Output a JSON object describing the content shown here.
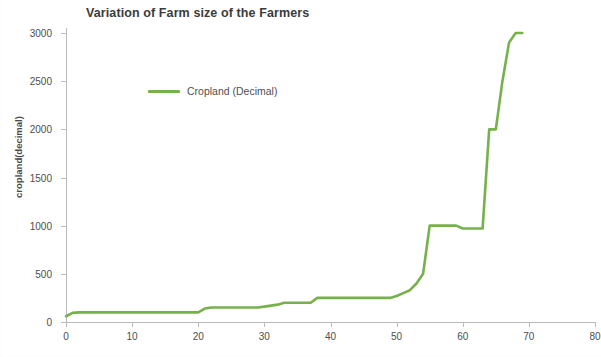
{
  "chart_data": {
    "type": "line",
    "title": "Variation of Farm size of the Farmers",
    "xlabel": "",
    "ylabel": "cropland(decimal)",
    "xlim": [
      0,
      80
    ],
    "ylim": [
      0,
      3000
    ],
    "grid": false,
    "legend_position": "inside-top-left",
    "line_color": "#77B14C",
    "axis_color": "#b9b9b9",
    "text_color": "#4d4d4d",
    "xticks": [
      0,
      10,
      20,
      30,
      40,
      50,
      60,
      70,
      80
    ],
    "yticks": [
      0,
      500,
      1000,
      1500,
      2000,
      2500,
      3000
    ],
    "xtick_labels": [
      "0",
      "10",
      "20",
      "30",
      "40",
      "50",
      "60",
      "70",
      "80"
    ],
    "ytick_labels": [
      "0",
      "500",
      "1000",
      "1500",
      "2000",
      "2500",
      "3000"
    ],
    "series": [
      {
        "name": "Cropland (Decimal)",
        "x": [
          0,
          1,
          2,
          3,
          4,
          5,
          6,
          7,
          8,
          9,
          10,
          11,
          12,
          13,
          14,
          15,
          16,
          17,
          18,
          19,
          20,
          21,
          22,
          23,
          24,
          25,
          26,
          27,
          28,
          29,
          30,
          31,
          32,
          33,
          34,
          35,
          36,
          37,
          38,
          39,
          40,
          41,
          42,
          43,
          44,
          45,
          46,
          47,
          48,
          49,
          50,
          51,
          52,
          53,
          54,
          55,
          56,
          57,
          58,
          59,
          60,
          61,
          62,
          63,
          64,
          65,
          66,
          67,
          68,
          69
        ],
        "values": [
          60,
          95,
          100,
          100,
          100,
          100,
          100,
          100,
          100,
          100,
          100,
          100,
          100,
          100,
          100,
          100,
          100,
          100,
          100,
          100,
          100,
          140,
          150,
          150,
          150,
          150,
          150,
          150,
          150,
          150,
          160,
          170,
          180,
          200,
          200,
          200,
          200,
          200,
          250,
          250,
          250,
          250,
          250,
          250,
          250,
          250,
          250,
          250,
          250,
          250,
          270,
          300,
          330,
          400,
          500,
          1000,
          1000,
          1000,
          1000,
          1000,
          970,
          970,
          970,
          970,
          2000,
          2000,
          2500,
          2900,
          3000,
          3000
        ]
      }
    ]
  },
  "legend": {
    "entries": [
      {
        "label": "Cropland (Decimal)",
        "color": "#77B14C"
      }
    ]
  }
}
